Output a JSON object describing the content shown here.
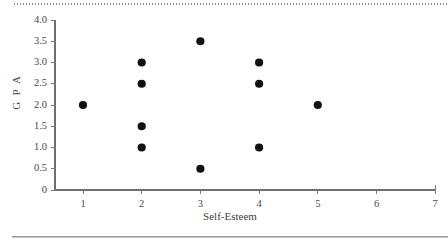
{
  "figure": {
    "top_rule_style": "dotted",
    "bottom_rule_style": "solid",
    "background_color": "#ffffff",
    "point_color": "#111111",
    "axis_color": "#6f6f6f"
  },
  "chart_data": {
    "type": "scatter",
    "title": "",
    "xlabel": "Self-Esteem",
    "ylabel": "G P A",
    "xlim": [
      0.5,
      7
    ],
    "ylim": [
      0,
      4.0
    ],
    "grid": false,
    "legend": null,
    "xticks": [
      1,
      2,
      3,
      4,
      5,
      6,
      7
    ],
    "xtick_labels": [
      "1",
      "2",
      "3",
      "4",
      "5",
      "6",
      "7"
    ],
    "yticks": [
      0,
      0.5,
      1.0,
      1.5,
      2.0,
      2.5,
      3.0,
      3.5,
      4.0
    ],
    "ytick_labels": [
      "0",
      "0.5",
      "1.0",
      "1.5",
      "2.0",
      "2.5",
      "3.0",
      "3.5",
      "4.0"
    ],
    "series": [
      {
        "name": "students",
        "marker": "circle",
        "color": "#111111",
        "points": [
          {
            "x": 1,
            "y": 2.0
          },
          {
            "x": 2,
            "y": 3.0
          },
          {
            "x": 2,
            "y": 2.5
          },
          {
            "x": 2,
            "y": 1.5
          },
          {
            "x": 2,
            "y": 1.0
          },
          {
            "x": 3,
            "y": 3.5
          },
          {
            "x": 3,
            "y": 0.5
          },
          {
            "x": 4,
            "y": 3.0
          },
          {
            "x": 4,
            "y": 2.5
          },
          {
            "x": 4,
            "y": 1.0
          },
          {
            "x": 5,
            "y": 2.0
          }
        ]
      }
    ]
  }
}
